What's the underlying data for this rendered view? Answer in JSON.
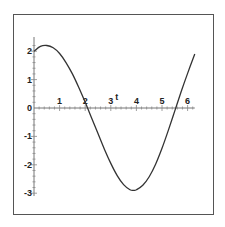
{
  "chart_data": {
    "type": "line",
    "title": "",
    "xlabel": "t",
    "ylabel": "",
    "xlim": [
      0,
      6.28
    ],
    "ylim": [
      -3.1,
      2.5
    ],
    "grid": false,
    "legend": null,
    "x_ticks": [
      "1",
      "2",
      "3",
      "4",
      "5",
      "6"
    ],
    "y_ticks": [
      "-3",
      "-2",
      "-1",
      "0",
      "1",
      "2"
    ],
    "series": [
      {
        "name": "f(t)",
        "color": "#333333",
        "x": [
          0,
          0.25,
          0.5,
          0.75,
          1.0,
          1.25,
          1.5,
          1.75,
          2.0,
          2.25,
          2.5,
          2.75,
          3.0,
          3.25,
          3.5,
          3.75,
          3.9,
          4.0,
          4.25,
          4.5,
          4.75,
          5.0,
          5.25,
          5.5,
          5.75,
          6.0,
          6.28
        ],
        "y": [
          2.0,
          2.17,
          2.2,
          2.12,
          1.92,
          1.6,
          1.2,
          0.72,
          0.2,
          -0.35,
          -0.9,
          -1.45,
          -1.95,
          -2.38,
          -2.7,
          -2.88,
          -2.9,
          -2.88,
          -2.72,
          -2.42,
          -1.98,
          -1.42,
          -0.78,
          -0.1,
          0.58,
          1.22,
          1.9
        ]
      }
    ]
  },
  "axes": {
    "x_label": "t",
    "x_tick_labels": [
      "1",
      "2",
      "3",
      "4",
      "5",
      "6"
    ],
    "y_tick_labels": [
      "2",
      "1",
      "0",
      "-1",
      "-2",
      "-3"
    ]
  }
}
